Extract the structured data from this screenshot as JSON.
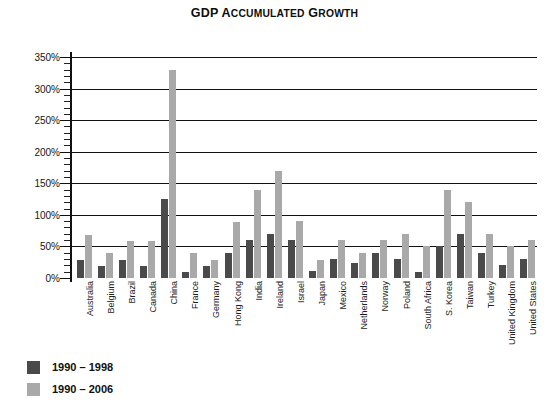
{
  "chart_data": {
    "type": "bar",
    "title": "GDP Accumulated Growth",
    "title_first_letters": "GDP A",
    "xlabel": "",
    "ylabel": "",
    "ylim": [
      0,
      350
    ],
    "ytick_labels": [
      "0%",
      "50%",
      "100%",
      "150%",
      "200%",
      "250%",
      "300%",
      "350%"
    ],
    "ytick_values": [
      0,
      50,
      100,
      150,
      200,
      250,
      300,
      350
    ],
    "minor_tick_step": 10,
    "grid": "horizontal",
    "legend_position": "below-left",
    "units": "percent",
    "categories": [
      "Australia",
      "Belgium",
      "Brazil",
      "Canada",
      "China",
      "France",
      "Germany",
      "Hong Kong",
      "India",
      "Ireland",
      "Israel",
      "Japan",
      "Mexico",
      "Netherlands",
      "Norway",
      "Poland",
      "South Africa",
      "S. Korea",
      "Taiwan",
      "Turkey",
      "United Kingdom",
      "United States"
    ],
    "series": [
      {
        "name": "1990 – 1998",
        "color": "#4a4a4a",
        "values": [
          29,
          19,
          29,
          19,
          125,
          9,
          19,
          39,
          60,
          70,
          60,
          11,
          30,
          24,
          40,
          30,
          10,
          50,
          70,
          40,
          20,
          30
        ]
      },
      {
        "name": "1990 – 2006",
        "color": "#a9a9a9",
        "values": [
          68,
          39,
          58,
          58,
          330,
          39,
          29,
          89,
          140,
          170,
          90,
          29,
          60,
          39,
          60,
          69,
          50,
          140,
          120,
          69,
          50,
          60
        ]
      }
    ]
  },
  "legend": {
    "items": [
      {
        "label": "1990 – 1998",
        "color": "#4a4a4a"
      },
      {
        "label": "1990 – 2006",
        "color": "#a9a9a9"
      }
    ]
  }
}
